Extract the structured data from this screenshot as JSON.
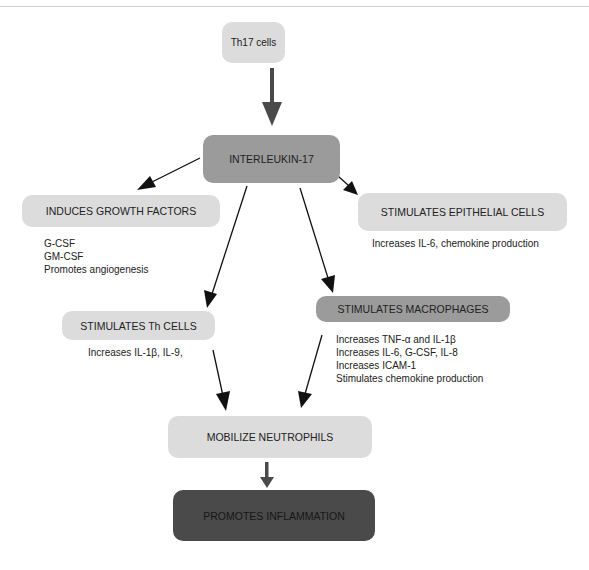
{
  "diagram": {
    "nodes": {
      "th17": {
        "label": "Th17 cells"
      },
      "il17": {
        "label": "INTERLEUKIN-17"
      },
      "growth": {
        "label": "INDUCES GROWTH FACTORS"
      },
      "epithelial": {
        "label": "STIMULATES EPITHELIAL CELLS"
      },
      "thcells": {
        "label": "STIMULATES Th CELLS"
      },
      "macrophages": {
        "label": "STIMULATES MACROPHAGES"
      },
      "neutrophils": {
        "label": "MOBILIZE NEUTROPHILS"
      },
      "inflammation": {
        "label": "PROMOTES INFLAMMATION"
      }
    },
    "notes": {
      "growth": [
        "G-CSF",
        "GM-CSF",
        "Promotes angiogenesis"
      ],
      "epithelial": [
        "Increases IL-6, chemokine production"
      ],
      "thcells": [
        "Increases IL-1β, IL-9,"
      ],
      "macrophages": [
        "Increases TNF-α and IL-1β",
        "Increases IL-6, G-CSF, IL-8",
        "Increases ICAM-1",
        "Stimulates chemokine production"
      ]
    },
    "edges": [
      {
        "from": "th17",
        "to": "il17"
      },
      {
        "from": "il17",
        "to": "growth"
      },
      {
        "from": "il17",
        "to": "epithelial"
      },
      {
        "from": "il17",
        "to": "thcells"
      },
      {
        "from": "il17",
        "to": "macrophages"
      },
      {
        "from": "thcells",
        "to": "neutrophils"
      },
      {
        "from": "macrophages",
        "to": "neutrophils"
      },
      {
        "from": "neutrophils",
        "to": "inflammation"
      }
    ],
    "colors": {
      "light_box": "#dcdcdc",
      "mid_box": "#9b9b9b",
      "dark_box": "#4a4a4a",
      "thick_arrow": "#4a4a4a",
      "thin_arrow": "#111111"
    }
  }
}
